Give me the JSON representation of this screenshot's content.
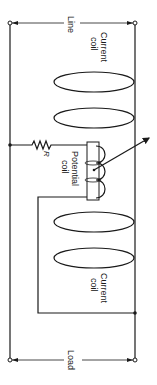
{
  "diagram": {
    "labels": {
      "line": "Line",
      "load": "Load",
      "current_coil_top_1": "Current",
      "current_coil_top_2": "coil",
      "current_coil_bottom_1": "Current",
      "current_coil_bottom_2": "coil",
      "potential_coil_1": "Potential",
      "potential_coil_2": "coil",
      "resistor": "R"
    },
    "components": [
      {
        "type": "terminal-pair",
        "name": "Line"
      },
      {
        "type": "current-coil",
        "turns": 2,
        "position": "upper"
      },
      {
        "type": "resistor",
        "name": "R"
      },
      {
        "type": "potential-coil",
        "turns": 3
      },
      {
        "type": "pointer-arrow"
      },
      {
        "type": "current-coil",
        "turns": 2,
        "position": "lower"
      },
      {
        "type": "terminal-pair",
        "name": "Load"
      }
    ],
    "colors": {
      "ink": "#1a1a1a",
      "background": "#ffffff"
    }
  }
}
